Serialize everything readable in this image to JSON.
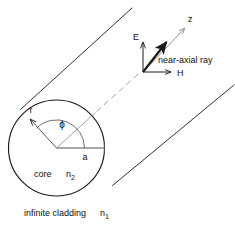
{
  "figure": {
    "background_color": "#ffffff",
    "ink_color": "#1a1a1a",
    "axis_color": "#9a9a9a",
    "width": 235,
    "height": 230
  },
  "core": {
    "region_label": "core",
    "index_symbol": "n",
    "index_subscript": "2",
    "radius_label": "a",
    "radial_coord_label": "r",
    "angle_label": "ϕ",
    "center_x": 56.5,
    "center_y": 148,
    "radius": 48
  },
  "cladding": {
    "caption": "infinite cladding",
    "index_symbol": "n",
    "index_subscript": "1"
  },
  "ray": {
    "label": "near-axial ray",
    "origin_x": 143,
    "origin_y": 72
  },
  "axes": {
    "z_label": "z",
    "e_label": "E",
    "h_label": "H"
  }
}
